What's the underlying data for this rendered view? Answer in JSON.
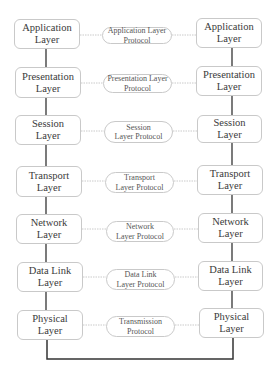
{
  "diagram": {
    "type": "OSI model peer-to-peer communication",
    "colors": {
      "box_border": "#c9c9c9",
      "stack_line": "#333333",
      "peer_line": "#bdbdbd",
      "text": "#3a3a3a"
    },
    "left_stack": [
      {
        "line1": "Application",
        "line2": "Layer"
      },
      {
        "line1": "Presentation",
        "line2": "Layer"
      },
      {
        "line1": "Session",
        "line2": "Layer"
      },
      {
        "line1": "Transport",
        "line2": "Layer"
      },
      {
        "line1": "Network",
        "line2": "Layer"
      },
      {
        "line1": "Data Link",
        "line2": "Layer"
      },
      {
        "line1": "Physical",
        "line2": "Layer"
      }
    ],
    "right_stack": [
      {
        "line1": "Application",
        "line2": "Layer"
      },
      {
        "line1": "Presentation",
        "line2": "Layer"
      },
      {
        "line1": "Session",
        "line2": "Layer"
      },
      {
        "line1": "Transport",
        "line2": "Layer"
      },
      {
        "line1": "Network",
        "line2": "Layer"
      },
      {
        "line1": "Data Link",
        "line2": "Layer"
      },
      {
        "line1": "Physical",
        "line2": "Layer"
      }
    ],
    "protocols": [
      {
        "line1": "Application Layer",
        "line2": "Protocol"
      },
      {
        "line1": "Presentation Layer",
        "line2": "Protocol"
      },
      {
        "line1": "Session",
        "line2": "Layer Protocol"
      },
      {
        "line1": "Transport",
        "line2": "Layer Protocol"
      },
      {
        "line1": "Network",
        "line2": "Layer Protocol"
      },
      {
        "line1": "Data Link",
        "line2": "Layer Protocol"
      },
      {
        "line1": "Transmission",
        "line2": "Protocol"
      }
    ]
  }
}
